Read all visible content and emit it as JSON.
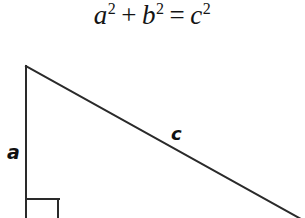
{
  "page": {
    "background_color": "#ffffff",
    "width": 305,
    "height": 218
  },
  "equation": {
    "full_text": "a² + b² = c²",
    "term_a": "a",
    "exp_a": "2",
    "operator_plus": "+",
    "term_b": "b",
    "exp_b": "2",
    "operator_equals": "=",
    "term_c": "c",
    "exp_c": "2",
    "color": "#141414"
  },
  "diagram": {
    "type": "right-triangle",
    "stroke_color": "#2a2a2a",
    "stroke_width": 2,
    "vertical_leg": {
      "label": "a",
      "x1": 26,
      "y1": 66,
      "x2": 26,
      "y2": 218
    },
    "hypotenuse": {
      "label": "c",
      "x1": 26,
      "y1": 66,
      "x2": 300,
      "y2": 218
    },
    "right_angle_marker": {
      "corner_x": 26,
      "corner_y": 218,
      "size": 33,
      "horizontal_y": 199,
      "vertical_x": 58
    },
    "labels": {
      "leg_a": "a",
      "hypotenuse_c": "c"
    }
  }
}
